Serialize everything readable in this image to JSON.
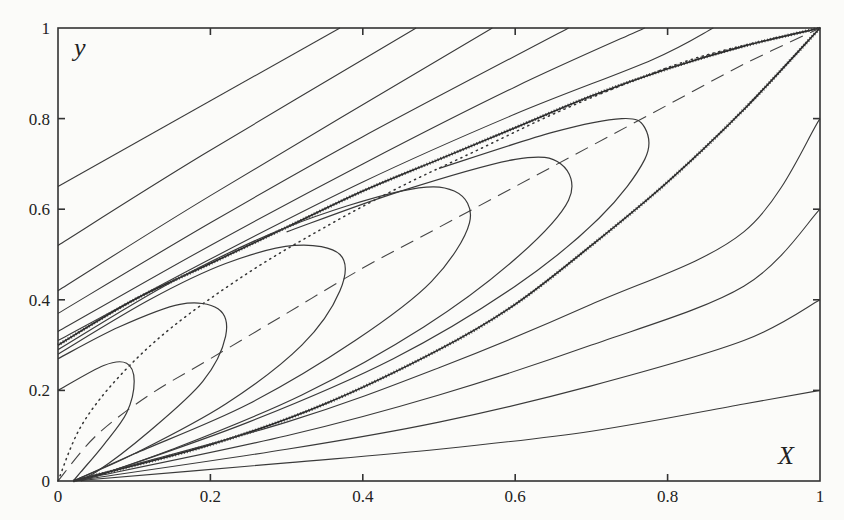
{
  "chart_data": {
    "type": "line",
    "title": "",
    "xlabel": "X",
    "ylabel": "y",
    "xlim": [
      0,
      1
    ],
    "ylim": [
      0,
      1
    ],
    "grid": false,
    "legend": null,
    "x_ticks": [
      "0",
      "0.2",
      "0.4",
      "0.6",
      "0.8",
      "1"
    ],
    "y_ticks": [
      "0",
      "0.2",
      "0.4",
      "0.6",
      "0.8",
      "1"
    ],
    "series": [
      {
        "name": "upper-left line 1",
        "style": "solid",
        "points": [
          [
            0.0,
            0.65
          ],
          [
            0.37,
            1.0
          ]
        ]
      },
      {
        "name": "upper-left line 2",
        "style": "solid",
        "points": [
          [
            0.0,
            0.52
          ],
          [
            0.19,
            0.72
          ],
          [
            0.47,
            1.0
          ]
        ]
      },
      {
        "name": "upper-left line 3",
        "style": "solid",
        "points": [
          [
            0.0,
            0.42
          ],
          [
            0.2,
            0.63
          ],
          [
            0.57,
            1.0
          ]
        ]
      },
      {
        "name": "upper-left line 4",
        "style": "solid",
        "points": [
          [
            0.0,
            0.37
          ],
          [
            0.2,
            0.57
          ],
          [
            0.4,
            0.76
          ],
          [
            0.67,
            1.0
          ]
        ]
      },
      {
        "name": "upper-left line 5",
        "style": "solid",
        "points": [
          [
            0.0,
            0.33
          ],
          [
            0.2,
            0.52
          ],
          [
            0.4,
            0.7
          ],
          [
            0.6,
            0.87
          ],
          [
            0.77,
            1.0
          ]
        ]
      },
      {
        "name": "upper-left line 6",
        "style": "solid",
        "points": [
          [
            0.0,
            0.31
          ],
          [
            0.2,
            0.49
          ],
          [
            0.4,
            0.66
          ],
          [
            0.6,
            0.81
          ],
          [
            0.78,
            0.93
          ],
          [
            0.86,
            1.0
          ]
        ]
      },
      {
        "name": "upper separatrix (hatched)",
        "style": "hatched",
        "points": [
          [
            0.0,
            0.3
          ],
          [
            0.1,
            0.4
          ],
          [
            0.2,
            0.48
          ],
          [
            0.3,
            0.56
          ],
          [
            0.4,
            0.64
          ],
          [
            0.5,
            0.71
          ],
          [
            0.6,
            0.78
          ],
          [
            0.7,
            0.85
          ],
          [
            0.8,
            0.91
          ],
          [
            0.9,
            0.96
          ],
          [
            1.0,
            1.0
          ]
        ]
      },
      {
        "name": "dotted curve",
        "style": "dotted",
        "points": [
          [
            0.0,
            0.0
          ],
          [
            0.03,
            0.12
          ],
          [
            0.08,
            0.23
          ],
          [
            0.15,
            0.34
          ],
          [
            0.25,
            0.46
          ],
          [
            0.35,
            0.56
          ],
          [
            0.45,
            0.65
          ],
          [
            0.55,
            0.73
          ],
          [
            0.65,
            0.81
          ],
          [
            0.75,
            0.88
          ],
          [
            0.85,
            0.94
          ],
          [
            1.0,
            1.0
          ]
        ]
      },
      {
        "name": "dashed curve",
        "style": "dashed",
        "points": [
          [
            0.0,
            0.0
          ],
          [
            0.05,
            0.1
          ],
          [
            0.12,
            0.19
          ],
          [
            0.2,
            0.27
          ],
          [
            0.3,
            0.37
          ],
          [
            0.4,
            0.47
          ],
          [
            0.5,
            0.56
          ],
          [
            0.6,
            0.65
          ],
          [
            0.7,
            0.74
          ],
          [
            0.8,
            0.83
          ],
          [
            0.9,
            0.92
          ],
          [
            1.0,
            1.0
          ]
        ]
      },
      {
        "name": "loop 1",
        "style": "solid",
        "points": [
          [
            0.0,
            0.2
          ],
          [
            0.06,
            0.255
          ],
          [
            0.09,
            0.26
          ],
          [
            0.1,
            0.22
          ],
          [
            0.09,
            0.15
          ],
          [
            0.06,
            0.08
          ],
          [
            0.03,
            0.02
          ],
          [
            0.02,
            0.0
          ]
        ]
      },
      {
        "name": "loop 2",
        "style": "solid",
        "points": [
          [
            0.0,
            0.27
          ],
          [
            0.08,
            0.34
          ],
          [
            0.16,
            0.39
          ],
          [
            0.21,
            0.38
          ],
          [
            0.22,
            0.32
          ],
          [
            0.19,
            0.22
          ],
          [
            0.12,
            0.11
          ],
          [
            0.05,
            0.02
          ],
          [
            0.02,
            0.0
          ]
        ]
      },
      {
        "name": "loop 3",
        "style": "solid",
        "points": [
          [
            0.0,
            0.28
          ],
          [
            0.12,
            0.4
          ],
          [
            0.22,
            0.48
          ],
          [
            0.31,
            0.52
          ],
          [
            0.37,
            0.5
          ],
          [
            0.37,
            0.42
          ],
          [
            0.32,
            0.3
          ],
          [
            0.22,
            0.17
          ],
          [
            0.1,
            0.06
          ],
          [
            0.02,
            0.0
          ]
        ]
      },
      {
        "name": "loop 4",
        "style": "solid",
        "points": [
          [
            0.0,
            0.29
          ],
          [
            0.15,
            0.44
          ],
          [
            0.3,
            0.56
          ],
          [
            0.45,
            0.64
          ],
          [
            0.52,
            0.64
          ],
          [
            0.54,
            0.57
          ],
          [
            0.49,
            0.44
          ],
          [
            0.39,
            0.31
          ],
          [
            0.25,
            0.17
          ],
          [
            0.1,
            0.06
          ],
          [
            0.02,
            0.0
          ]
        ]
      },
      {
        "name": "loop 5",
        "style": "solid",
        "points": [
          [
            0.3,
            0.55
          ],
          [
            0.45,
            0.64
          ],
          [
            0.6,
            0.71
          ],
          [
            0.66,
            0.7
          ],
          [
            0.67,
            0.62
          ],
          [
            0.6,
            0.49
          ],
          [
            0.48,
            0.34
          ],
          [
            0.32,
            0.19
          ],
          [
            0.15,
            0.07
          ],
          [
            0.03,
            0.0
          ]
        ]
      },
      {
        "name": "loop 6",
        "style": "solid",
        "points": [
          [
            0.5,
            0.69
          ],
          [
            0.65,
            0.77
          ],
          [
            0.74,
            0.8
          ],
          [
            0.77,
            0.78
          ],
          [
            0.77,
            0.71
          ],
          [
            0.71,
            0.58
          ],
          [
            0.6,
            0.43
          ],
          [
            0.44,
            0.27
          ],
          [
            0.25,
            0.13
          ],
          [
            0.05,
            0.01
          ]
        ]
      },
      {
        "name": "lower separatrix (hatched)",
        "style": "hatched",
        "points": [
          [
            0.02,
            0.0
          ],
          [
            0.2,
            0.08
          ],
          [
            0.35,
            0.17
          ],
          [
            0.5,
            0.29
          ],
          [
            0.6,
            0.39
          ],
          [
            0.7,
            0.52
          ],
          [
            0.8,
            0.66
          ],
          [
            0.9,
            0.82
          ],
          [
            1.0,
            1.0
          ]
        ]
      },
      {
        "name": "lower-right line 1",
        "style": "solid",
        "points": [
          [
            0.02,
            0.0
          ],
          [
            0.3,
            0.13
          ],
          [
            0.5,
            0.25
          ],
          [
            0.7,
            0.39
          ],
          [
            0.9,
            0.55
          ],
          [
            1.0,
            0.8
          ]
        ]
      },
      {
        "name": "lower-right line 2",
        "style": "solid",
        "points": [
          [
            0.02,
            0.0
          ],
          [
            0.3,
            0.1
          ],
          [
            0.5,
            0.19
          ],
          [
            0.7,
            0.3
          ],
          [
            0.9,
            0.43
          ],
          [
            1.0,
            0.6
          ]
        ]
      },
      {
        "name": "lower-right line 3",
        "style": "solid",
        "points": [
          [
            0.02,
            0.0
          ],
          [
            0.3,
            0.07
          ],
          [
            0.5,
            0.13
          ],
          [
            0.7,
            0.21
          ],
          [
            0.9,
            0.31
          ],
          [
            1.0,
            0.4
          ]
        ]
      },
      {
        "name": "lower-right line 4",
        "style": "solid",
        "points": [
          [
            0.02,
            0.0
          ],
          [
            0.3,
            0.04
          ],
          [
            0.5,
            0.07
          ],
          [
            0.7,
            0.11
          ],
          [
            0.9,
            0.17
          ],
          [
            1.0,
            0.2
          ]
        ]
      }
    ]
  },
  "axes": {
    "x_label": "X",
    "y_label": "y",
    "x_ticks": [
      {
        "label": "0",
        "value": 0
      },
      {
        "label": "0.2",
        "value": 0.2
      },
      {
        "label": "0.4",
        "value": 0.4
      },
      {
        "label": "0.6",
        "value": 0.6
      },
      {
        "label": "0.8",
        "value": 0.8
      },
      {
        "label": "1",
        "value": 1
      }
    ],
    "y_ticks": [
      {
        "label": "0",
        "value": 0
      },
      {
        "label": "0.2",
        "value": 0.2
      },
      {
        "label": "0.4",
        "value": 0.4
      },
      {
        "label": "0.6",
        "value": 0.6
      },
      {
        "label": "0.8",
        "value": 0.8
      },
      {
        "label": "1",
        "value": 1
      }
    ]
  }
}
